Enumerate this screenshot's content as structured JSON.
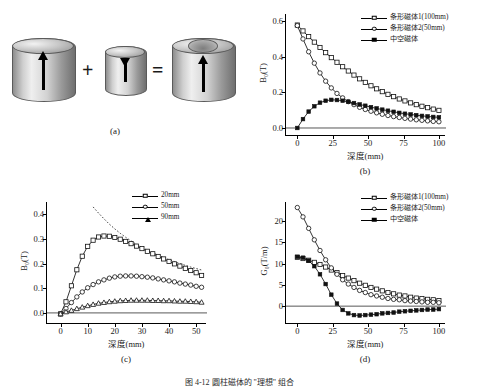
{
  "figure": {
    "caption": "图 4-12   圆柱磁体的 \"理想\" 组合",
    "panel_labels": {
      "a": "(a)",
      "b": "(b)",
      "c": "(c)",
      "d": "(d)"
    }
  },
  "panel_a": {
    "name": "磁体组合示意图",
    "plus_symbol": "+",
    "equals_symbol": "=",
    "items": [
      {
        "shape": "solid-cylinder",
        "label": "大圆柱磁体",
        "polarity": "up"
      },
      {
        "shape": "solid-cylinder",
        "label": "小圆柱磁体",
        "polarity": "down"
      },
      {
        "shape": "hollow-cylinder",
        "label": "中空磁体",
        "polarity": "up"
      }
    ]
  },
  "chart_data": [
    {
      "id": "panel_b",
      "type": "line",
      "title": "",
      "xlabel": "深度(mm)",
      "ylabel": "B₀(T)",
      "xlim": [
        -8,
        105
      ],
      "ylim": [
        -0.045,
        0.64
      ],
      "xticks": [
        "0",
        "25",
        "50",
        "75",
        "100"
      ],
      "xtickvals": [
        0,
        25,
        50,
        75,
        100
      ],
      "yticks": [
        "0.0",
        "0.2",
        "0.4",
        "0.6"
      ],
      "ytickvals": [
        0.0,
        0.2,
        0.4,
        0.6
      ],
      "grid": false,
      "legend_position": "top-right",
      "series": [
        {
          "name": "条形磁体1(100mm)",
          "marker": "square",
          "x": [
            0,
            4,
            8,
            12,
            16,
            20,
            24,
            28,
            32,
            36,
            40,
            44,
            48,
            52,
            56,
            60,
            64,
            68,
            72,
            76,
            80,
            84,
            88,
            92,
            96,
            100
          ],
          "y": [
            0.578,
            0.545,
            0.513,
            0.482,
            0.452,
            0.423,
            0.395,
            0.369,
            0.344,
            0.32,
            0.297,
            0.276,
            0.256,
            0.237,
            0.22,
            0.204,
            0.189,
            0.176,
            0.163,
            0.152,
            0.141,
            0.131,
            0.122,
            0.114,
            0.106,
            0.099
          ]
        },
        {
          "name": "条形磁体2(50mm)",
          "marker": "circle",
          "x": [
            0,
            4,
            8,
            12,
            16,
            20,
            24,
            28,
            32,
            36,
            40,
            44,
            48,
            52,
            56,
            60,
            64,
            68,
            72,
            76,
            80,
            84,
            88,
            92,
            96,
            100
          ],
          "y": [
            0.575,
            0.5,
            0.428,
            0.364,
            0.309,
            0.263,
            0.225,
            0.194,
            0.169,
            0.148,
            0.131,
            0.116,
            0.104,
            0.094,
            0.085,
            0.077,
            0.07,
            0.064,
            0.059,
            0.054,
            0.05,
            0.046,
            0.043,
            0.04,
            0.037,
            0.035
          ]
        },
        {
          "name": "中空磁体",
          "marker": "filled",
          "x": [
            0,
            4,
            8,
            12,
            16,
            20,
            24,
            28,
            32,
            36,
            40,
            44,
            48,
            52,
            56,
            60,
            64,
            68,
            72,
            76,
            80,
            84,
            88,
            92,
            96,
            100
          ],
          "y": [
            0.0,
            0.05,
            0.092,
            0.122,
            0.142,
            0.153,
            0.158,
            0.157,
            0.153,
            0.147,
            0.14,
            0.132,
            0.125,
            0.117,
            0.11,
            0.103,
            0.097,
            0.091,
            0.085,
            0.08,
            0.076,
            0.072,
            0.068,
            0.065,
            0.062,
            0.06
          ]
        }
      ]
    },
    {
      "id": "panel_c",
      "type": "line",
      "title": "",
      "xlabel": "深度(mm)",
      "ylabel": "B₀(T)",
      "xlim": [
        -5,
        54
      ],
      "ylim": [
        -0.045,
        0.45
      ],
      "xticks": [
        "0",
        "10",
        "20",
        "30",
        "40",
        "50"
      ],
      "xtickvals": [
        0,
        10,
        20,
        30,
        40,
        50
      ],
      "yticks": [
        "0.0",
        "0.1",
        "0.2",
        "0.3",
        "0.4"
      ],
      "ytickvals": [
        0.0,
        0.1,
        0.2,
        0.3,
        0.4
      ],
      "grid": false,
      "legend_position": "top-right",
      "series": [
        {
          "name": "20mm",
          "marker": "square",
          "x": [
            0,
            2,
            4,
            6,
            8,
            10,
            12,
            14,
            16,
            18,
            20,
            22,
            24,
            26,
            28,
            30,
            32,
            34,
            36,
            38,
            40,
            42,
            44,
            46,
            48,
            50,
            52
          ],
          "y": [
            -0.004,
            0.045,
            0.11,
            0.175,
            0.23,
            0.27,
            0.295,
            0.308,
            0.312,
            0.311,
            0.306,
            0.299,
            0.29,
            0.281,
            0.271,
            0.261,
            0.25,
            0.24,
            0.229,
            0.219,
            0.209,
            0.199,
            0.19,
            0.181,
            0.172,
            0.163,
            0.152
          ]
        },
        {
          "name": "50mm",
          "marker": "circle",
          "x": [
            0,
            2,
            4,
            6,
            8,
            10,
            12,
            14,
            16,
            18,
            20,
            22,
            24,
            26,
            28,
            30,
            32,
            34,
            36,
            38,
            40,
            42,
            44,
            46,
            48,
            50,
            52
          ],
          "y": [
            -0.004,
            0.018,
            0.042,
            0.065,
            0.085,
            0.102,
            0.115,
            0.126,
            0.134,
            0.141,
            0.146,
            0.149,
            0.15,
            0.15,
            0.149,
            0.147,
            0.145,
            0.142,
            0.138,
            0.134,
            0.13,
            0.126,
            0.121,
            0.117,
            0.113,
            0.108,
            0.104
          ]
        },
        {
          "name": "90mm",
          "marker": "triangle",
          "x": [
            0,
            2,
            4,
            6,
            8,
            10,
            12,
            14,
            16,
            18,
            20,
            22,
            24,
            26,
            28,
            30,
            32,
            34,
            36,
            38,
            40,
            42,
            44,
            46,
            48,
            50,
            52
          ],
          "y": [
            -0.004,
            0.004,
            0.01,
            0.017,
            0.023,
            0.029,
            0.034,
            0.039,
            0.042,
            0.045,
            0.047,
            0.049,
            0.05,
            0.051,
            0.051,
            0.051,
            0.051,
            0.05,
            0.05,
            0.049,
            0.049,
            0.048,
            0.047,
            0.047,
            0.046,
            0.045,
            0.043
          ]
        }
      ],
      "annotations": [
        {
          "name": "渐近虚线",
          "style": "dotted",
          "x": [
            12,
            14,
            16,
            18,
            20,
            22,
            24,
            26,
            28,
            30,
            32,
            34,
            36,
            38,
            40,
            42,
            44,
            46,
            48,
            50,
            52
          ],
          "y": [
            0.43,
            0.405,
            0.382,
            0.36,
            0.341,
            0.323,
            0.307,
            0.292,
            0.278,
            0.266,
            0.254,
            0.244,
            0.234,
            0.225,
            0.216,
            0.208,
            0.2,
            0.193,
            0.186,
            0.18,
            0.174
          ]
        }
      ]
    },
    {
      "id": "panel_d",
      "type": "line",
      "title": "",
      "xlabel": "深度(mm)",
      "ylabel": "G₀(T/m)",
      "xlim": [
        -8,
        105
      ],
      "ylim": [
        -4.2,
        24.5
      ],
      "xticks": [
        "0",
        "25",
        "50",
        "75",
        "100"
      ],
      "xtickvals": [
        0,
        25,
        50,
        75,
        100
      ],
      "yticks": [
        "0",
        "5",
        "10",
        "15",
        "20"
      ],
      "ytickvals": [
        0,
        5,
        10,
        15,
        20
      ],
      "grid": false,
      "legend_position": "top-right",
      "series": [
        {
          "name": "条形磁体1(100mm)",
          "marker": "square",
          "x": [
            0,
            4,
            8,
            12,
            16,
            20,
            24,
            28,
            32,
            36,
            40,
            44,
            48,
            52,
            56,
            60,
            64,
            68,
            72,
            76,
            80,
            84,
            88,
            92,
            96,
            100
          ],
          "y": [
            11.5,
            11.2,
            10.8,
            10.3,
            9.8,
            9.2,
            8.5,
            7.9,
            7.2,
            6.6,
            6.0,
            5.4,
            4.9,
            4.4,
            4.0,
            3.6,
            3.2,
            2.9,
            2.6,
            2.4,
            2.1,
            1.9,
            1.8,
            1.6,
            1.5,
            1.3
          ]
        },
        {
          "name": "条形磁体2(50mm)",
          "marker": "circle",
          "x": [
            0,
            4,
            8,
            12,
            16,
            20,
            24,
            28,
            32,
            36,
            40,
            44,
            48,
            52,
            56,
            60,
            64,
            68,
            72,
            76,
            80,
            84,
            88,
            92,
            96,
            100
          ],
          "y": [
            23.2,
            21.0,
            18.3,
            15.6,
            13.1,
            10.9,
            9.0,
            7.5,
            6.2,
            5.2,
            4.4,
            3.7,
            3.2,
            2.7,
            2.4,
            2.1,
            1.8,
            1.6,
            1.5,
            1.3,
            1.2,
            1.1,
            1.0,
            0.9,
            0.9,
            0.8
          ]
        },
        {
          "name": "中空磁体",
          "marker": "filled",
          "x": [
            0,
            4,
            8,
            12,
            16,
            20,
            24,
            28,
            32,
            36,
            40,
            44,
            48,
            52,
            56,
            60,
            64,
            68,
            72,
            76,
            80,
            84,
            88,
            92,
            96,
            100
          ],
          "y": [
            11.6,
            11.4,
            10.7,
            9.4,
            7.5,
            5.2,
            2.7,
            0.6,
            -0.9,
            -1.7,
            -2.1,
            -2.2,
            -2.1,
            -2.0,
            -1.9,
            -1.7,
            -1.6,
            -1.5,
            -1.3,
            -1.2,
            -1.1,
            -1.0,
            -0.9,
            -0.8,
            -0.8,
            -0.7
          ]
        }
      ]
    }
  ]
}
